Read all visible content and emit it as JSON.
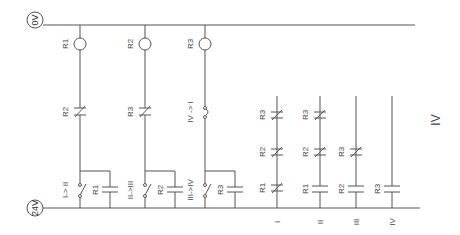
{
  "rails": {
    "top": "0V",
    "bottom": "24V"
  },
  "branches": [
    {
      "coil": "R1",
      "nc_contact": "R2",
      "switch": "I-> II",
      "cap": "R1"
    },
    {
      "coil": "R2",
      "nc_contact": "R3",
      "switch": "II->III",
      "cap": "R2"
    },
    {
      "coil": "R3",
      "nc_contact": "IV -> I",
      "switch": "III->IV",
      "cap": "R3"
    }
  ],
  "outputs": [
    {
      "name": "I",
      "contacts": [
        "R3",
        "R2",
        "R1"
      ]
    },
    {
      "name": "II",
      "contacts": [
        "R3",
        "R2",
        "R1"
      ]
    },
    {
      "name": "III",
      "contacts": [
        "R3",
        "R2"
      ]
    },
    {
      "name": "IV",
      "contacts": [
        "R3"
      ]
    }
  ],
  "side_label": "IV"
}
